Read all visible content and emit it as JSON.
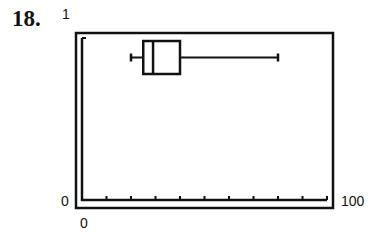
{
  "problem_number": "18.",
  "window": {
    "ymax_label": "1",
    "ymin_label": "0",
    "xmin_label": "0",
    "xmax_label": "100"
  },
  "chart_data": {
    "type": "boxplot",
    "title": "",
    "xlabel": "",
    "ylabel": "",
    "xlim": [
      0,
      100
    ],
    "ylim": [
      0,
      1
    ],
    "x_tick_interval": 10,
    "grid": false,
    "legend": null,
    "series": [
      {
        "name": "data",
        "min": 20,
        "q1": 25,
        "median": 29,
        "q3": 40,
        "max": 80
      }
    ],
    "axis_labels": {
      "y_top": "1",
      "y_bottom": "0",
      "x_left": "0",
      "x_right": "100"
    }
  }
}
